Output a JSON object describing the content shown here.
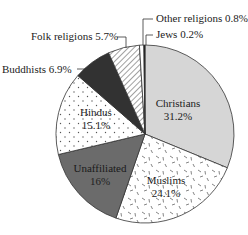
{
  "chart_data": {
    "type": "pie",
    "title": "",
    "start_angle_deg": 0,
    "direction": "clockwise",
    "center": [
      145,
      134
    ],
    "radius": 89,
    "slices": [
      {
        "label": "Christians",
        "value": 31.2,
        "display": "31.2%",
        "fill": "#d6d6d6",
        "pattern": "none",
        "label_inside": true,
        "label_pos": [
          178,
          107
        ]
      },
      {
        "label": "Muslims",
        "value": 24.1,
        "display": "24.1%",
        "fill": "#ffffff",
        "pattern": "dashes",
        "label_inside": true,
        "label_pos": [
          166,
          184
        ]
      },
      {
        "label": "Unaffiliated",
        "value": 16,
        "display": "16%",
        "fill": "#6b6b6b",
        "pattern": "none",
        "label_inside": true,
        "label_pos": [
          100,
          172
        ]
      },
      {
        "label": "Hindus",
        "value": 15.1,
        "display": "15.1%",
        "fill": "#ffffff",
        "pattern": "dots",
        "label_inside": true,
        "label_pos": [
          96,
          116
        ]
      },
      {
        "label": "Buddhists",
        "value": 6.9,
        "display": "6.9%",
        "fill": "#323232",
        "pattern": "none",
        "label_inside": false,
        "label_pos": [
          2,
          73
        ],
        "leader": [
          [
            77,
            69
          ],
          [
            95,
            69
          ]
        ]
      },
      {
        "label": "Folk religions",
        "value": 5.7,
        "display": "5.7%",
        "fill": "#ffffff",
        "pattern": "hatch",
        "label_inside": false,
        "label_pos": [
          31,
          40
        ],
        "leader": [
          [
            117,
            37
          ],
          [
            126,
            37
          ],
          [
            126,
            48
          ]
        ]
      },
      {
        "label": "Other religions",
        "value": 0.8,
        "display": "0.8%",
        "fill": "#ffffff",
        "pattern": "none",
        "label_inside": false,
        "label_pos": [
          156,
          22
        ],
        "leader": [
          [
            153,
            19
          ],
          [
            143,
            19
          ],
          [
            143,
            45
          ]
        ]
      },
      {
        "label": "Jews",
        "value": 0.2,
        "display": "0.2%",
        "fill": "#111111",
        "pattern": "none",
        "label_inside": false,
        "label_pos": [
          156,
          38
        ],
        "leader": [
          [
            153,
            35
          ],
          [
            146,
            35
          ],
          [
            146,
            45
          ]
        ]
      }
    ],
    "legend": "none"
  }
}
